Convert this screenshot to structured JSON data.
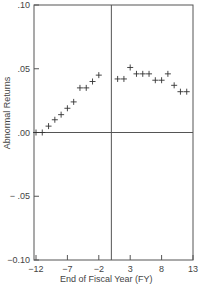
{
  "chart_data": {
    "type": "scatter",
    "title": "",
    "xlabel": "End of Fiscal Year (FY)",
    "ylabel": "Abnormal Returns",
    "xlim": [
      -12,
      13
    ],
    "ylim": [
      -0.1,
      0.1
    ],
    "x_ticks": [
      "-12",
      "-7",
      "-2",
      "3",
      "8",
      "13"
    ],
    "y_ticks": [
      ".10",
      ".05",
      ".00",
      "− .05",
      "−0.10"
    ],
    "grid": false,
    "marker": "+",
    "reference_lines": {
      "horizontal_y": 0.0,
      "vertical_x": 0
    },
    "x": [
      -12,
      -11,
      -10,
      -9,
      -8,
      -7,
      -6,
      -5,
      -4,
      -3,
      -2,
      1,
      2,
      3,
      4,
      5,
      6,
      7,
      8,
      9,
      10,
      11,
      12
    ],
    "values": [
      0.0,
      0.0,
      0.005,
      0.01,
      0.014,
      0.019,
      0.024,
      0.035,
      0.035,
      0.04,
      0.045,
      0.042,
      0.042,
      0.051,
      0.046,
      0.046,
      0.046,
      0.041,
      0.041,
      0.046,
      0.037,
      0.032,
      0.032
    ]
  }
}
